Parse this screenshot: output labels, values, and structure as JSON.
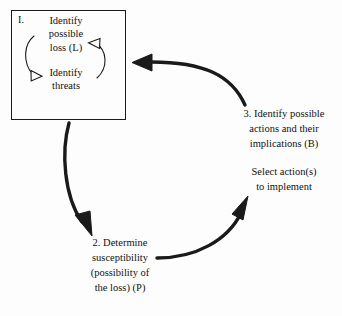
{
  "diagram": {
    "background_color": "#fdfdfd",
    "stroke_color": "#1a1a1a",
    "stage_one": {
      "label": "I.",
      "inner_nodes": [
        {
          "text": "Identify\npossible\nloss (L)"
        },
        {
          "text": "Identify\nthreats"
        }
      ],
      "inner_arrows": [
        {
          "name": "loss-to-threats-arc",
          "direction": "counterclockwise-left",
          "head": "hollow"
        },
        {
          "name": "threats-to-loss-arc",
          "direction": "clockwise-right",
          "head": "hollow"
        }
      ]
    },
    "stage_two": {
      "text": "2. Determine\nsusceptibility\n(possibility of\nthe loss)  (P)"
    },
    "stage_three": {
      "text": "3. Identify possible\nactions and their\nimplications (B)",
      "note": "Select action(s)\nto implement"
    },
    "flow_arrows": [
      {
        "name": "arrow-stage-one-to-stage-two",
        "from": "stage_one",
        "to": "stage_two"
      },
      {
        "name": "arrow-stage-two-to-stage-three",
        "from": "stage_two",
        "to": "stage_three"
      },
      {
        "name": "arrow-stage-three-to-stage-one",
        "from": "stage_three",
        "to": "stage_one"
      }
    ]
  }
}
